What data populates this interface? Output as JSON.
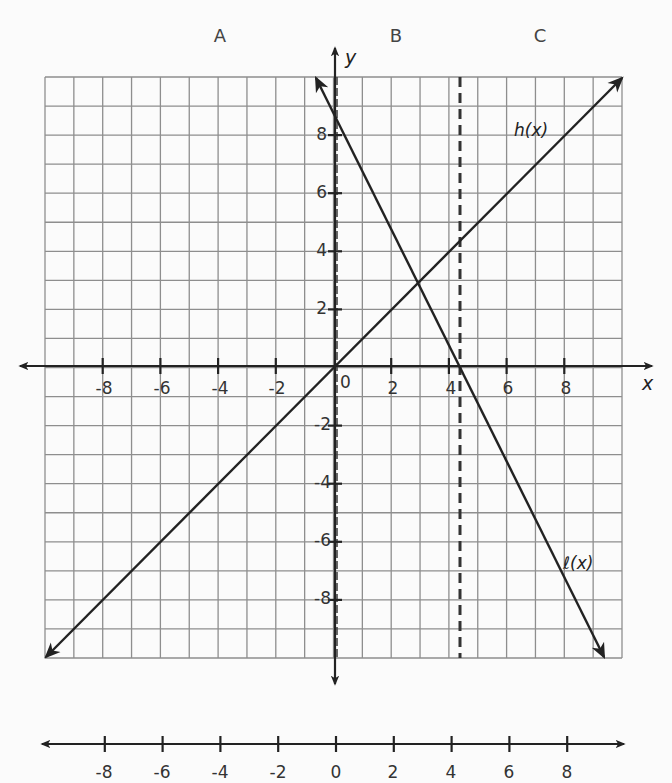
{
  "chart_data": [
    {
      "type": "line",
      "title": "",
      "xlabel": "x",
      "ylabel": "y",
      "xlim": [
        -10,
        10
      ],
      "ylim": [
        -10,
        10
      ],
      "grid": true,
      "x_ticks": [
        -8,
        -6,
        -4,
        -2,
        0,
        2,
        4,
        6,
        8
      ],
      "y_ticks": [
        -8,
        -6,
        -4,
        -2,
        2,
        4,
        6,
        8
      ],
      "series": [
        {
          "name": "h(x)",
          "equation": "h(x) = x",
          "points": [
            [
              -10,
              -10
            ],
            [
              10,
              10
            ]
          ]
        },
        {
          "name": "ℓ(x)",
          "equation": "ℓ(x) ≈ -2x + 8.6",
          "points": [
            [
              -0.7,
              10
            ],
            [
              9.3,
              -10
            ]
          ]
        }
      ],
      "annotations": [
        {
          "type": "vertical-dashed-line",
          "x": 0,
          "note": "dashed line along y-axis"
        },
        {
          "type": "vertical-dashed-line",
          "x": 4.3
        },
        {
          "type": "region-label",
          "text": "A",
          "region": "x < 0"
        },
        {
          "type": "region-label",
          "text": "B",
          "region": "0 < x < 4.3"
        },
        {
          "type": "region-label",
          "text": "C",
          "region": "x > 4.3"
        }
      ],
      "intersection": [
        2.87,
        2.87
      ]
    },
    {
      "type": "number-line",
      "ticks": [
        -8,
        -6,
        -4,
        -2,
        0,
        2,
        4,
        6,
        8
      ],
      "range": [
        -10,
        10
      ]
    }
  ],
  "labels": {
    "region_a": "A",
    "region_b": "B",
    "region_c": "C",
    "x_axis": "x",
    "y_axis": "y",
    "h_fn": "h(x)",
    "l_fn": "ℓ(x)",
    "origin": "0"
  },
  "x_tick_labels": [
    "-8",
    "-6",
    "-4",
    "-2",
    "2",
    "4",
    "6",
    "8"
  ],
  "y_tick_labels": [
    "8",
    "6",
    "4",
    "2",
    "-2",
    "-4",
    "-6",
    "-8"
  ],
  "number_line_labels": [
    "-8",
    "-6",
    "-4",
    "-2",
    "0",
    "2",
    "4",
    "6",
    "8"
  ]
}
